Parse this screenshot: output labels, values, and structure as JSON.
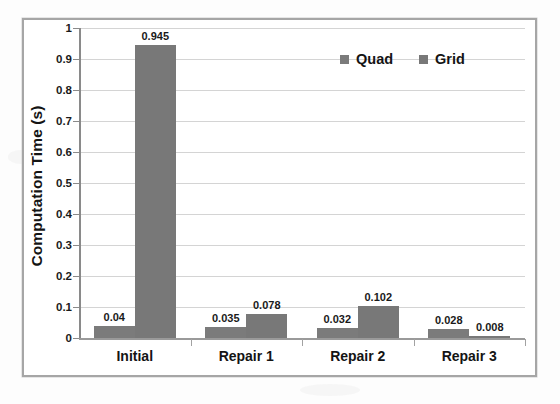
{
  "chart_data": {
    "type": "bar",
    "title": "",
    "xlabel": "",
    "ylabel": "Computation Time (s)",
    "categories": [
      "Initial",
      "Repair 1",
      "Repair 2",
      "Repair 3"
    ],
    "series": [
      {
        "name": "Quad",
        "values": [
          0.04,
          0.035,
          0.032,
          0.028
        ],
        "color": "#7b7b7b"
      },
      {
        "name": "Grid",
        "values": [
          0.945,
          0.078,
          0.102,
          0.008
        ],
        "color": "#787878"
      }
    ],
    "data_labels": [
      [
        "0.04",
        "0.035",
        "0.032",
        "0.028"
      ],
      [
        "0.945",
        "0.078",
        "0.102",
        "0.008"
      ]
    ],
    "ylim": [
      0,
      1
    ],
    "ytick_labels": [
      "1",
      "0.9",
      "0.8",
      "0.7",
      "0.6",
      "0.5",
      "0.4",
      "0.3",
      "0.2",
      "0.1",
      "0"
    ],
    "ytick_values": [
      1,
      0.9,
      0.8,
      0.7,
      0.6,
      0.5,
      0.4,
      0.3,
      0.2,
      0.1,
      0
    ],
    "grid": true,
    "legend_position": "top-right"
  },
  "legend": {
    "entries": [
      {
        "label": "Quad",
        "swatch": "legend-swatch-quad"
      },
      {
        "label": "Grid",
        "swatch": "legend-swatch-grid"
      }
    ]
  },
  "axes": {
    "y_title": "Computation Time (s)"
  },
  "colors": {
    "bar_quad": "#7b7b7b",
    "bar_grid": "#787878",
    "gridline": "#d4d4d4",
    "axis": "#8a8a8a",
    "frame": "#a6a6a6",
    "text": "#141414",
    "background": "#ffffff"
  }
}
